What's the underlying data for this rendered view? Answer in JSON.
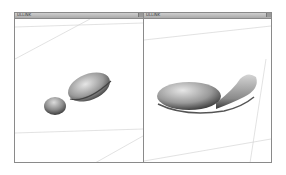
{
  "viewports": [
    {
      "title": "ULLINK",
      "object": "3d-shape-dumbbell-tilted",
      "grid_color": "#c8c8c8"
    },
    {
      "title": "ULLINK",
      "object": "3d-shape-elongated-lying",
      "grid_color": "#c8c8c8"
    }
  ],
  "colors": {
    "frame": "#8a8a8a",
    "titlebar": "#b5b5b5",
    "background": "#ffffff",
    "shape_light": "#d9d9d9",
    "shape_dark": "#3a3a3a"
  }
}
